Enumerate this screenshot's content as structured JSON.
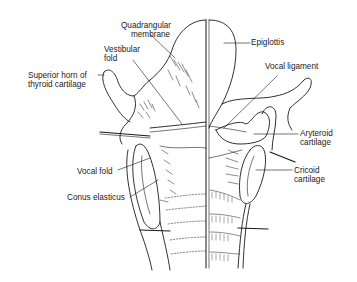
{
  "diagram": {
    "labels": {
      "quadrangular_membrane": [
        "Quadrangular",
        "membrane"
      ],
      "vestibular_fold": [
        "Vestibular",
        "fold"
      ],
      "superior_horn": [
        "Superior horn of",
        "thyroid cartilage"
      ],
      "vocal_fold": "Vocal fold",
      "conus_elasticus": "Conus elasticus",
      "epiglottis": "Epiglottis",
      "vocal_ligament": "Vocal ligament",
      "arytenoid": [
        "Aryteroid",
        "cartilage"
      ],
      "cricoid": [
        "Cricoid",
        "cartilage"
      ]
    },
    "colors": {
      "ink": "#1a1a1a",
      "background": "#ffffff"
    }
  }
}
